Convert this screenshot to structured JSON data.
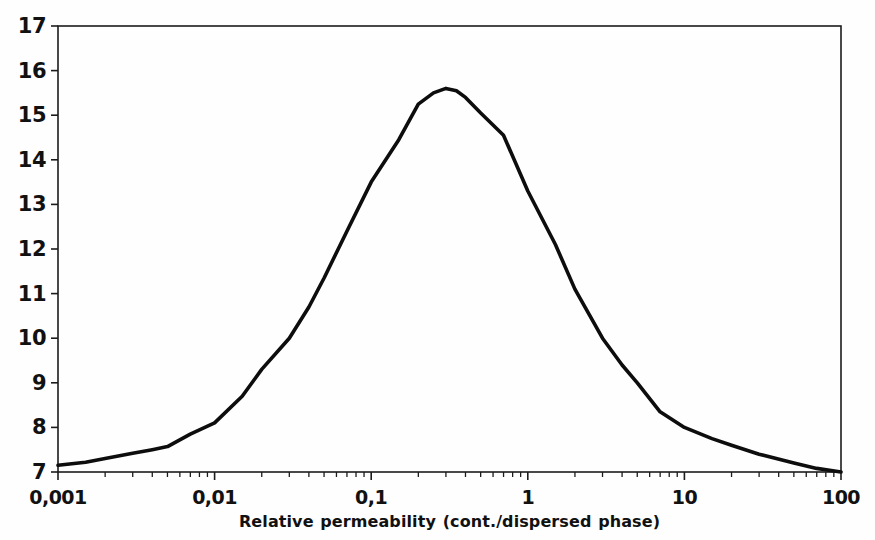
{
  "figure": {
    "background_color": "#fefefe",
    "axis_color": "#1c1c1c",
    "curve_color": "#0d0d0d",
    "label_color": "#111111"
  },
  "chart_data": {
    "type": "line",
    "title": "",
    "xlabel": "Relative permeability (cont./dispersed phase)",
    "ylabel": "",
    "x_scale": "log",
    "xlim": [
      0.001,
      100
    ],
    "ylim": [
      7,
      17
    ],
    "grid": false,
    "legend": "none",
    "x_tick_values": [
      0.001,
      0.01,
      0.1,
      1,
      10,
      100
    ],
    "x_tick_labels": [
      "0,001",
      "0,01",
      "0,1",
      "1",
      "10",
      "100"
    ],
    "y_tick_values": [
      7,
      8,
      9,
      10,
      11,
      12,
      13,
      14,
      15,
      16,
      17
    ],
    "y_tick_labels": [
      "7",
      "8",
      "9",
      "10",
      "11",
      "12",
      "13",
      "14",
      "15",
      "16",
      "17"
    ],
    "series": [
      {
        "name": "curve",
        "points": [
          [
            0.001,
            7.15
          ],
          [
            0.0015,
            7.22
          ],
          [
            0.002,
            7.3
          ],
          [
            0.003,
            7.42
          ],
          [
            0.004,
            7.5
          ],
          [
            0.005,
            7.57
          ],
          [
            0.007,
            7.85
          ],
          [
            0.01,
            8.1
          ],
          [
            0.015,
            8.7
          ],
          [
            0.02,
            9.3
          ],
          [
            0.03,
            10.0
          ],
          [
            0.04,
            10.7
          ],
          [
            0.05,
            11.35
          ],
          [
            0.07,
            12.4
          ],
          [
            0.1,
            13.5
          ],
          [
            0.15,
            14.45
          ],
          [
            0.2,
            15.25
          ],
          [
            0.25,
            15.5
          ],
          [
            0.3,
            15.6
          ],
          [
            0.35,
            15.55
          ],
          [
            0.4,
            15.4
          ],
          [
            0.5,
            15.05
          ],
          [
            0.7,
            14.55
          ],
          [
            1,
            13.3
          ],
          [
            1.5,
            12.1
          ],
          [
            2,
            11.1
          ],
          [
            3,
            10.0
          ],
          [
            4,
            9.4
          ],
          [
            5,
            9.0
          ],
          [
            7,
            8.35
          ],
          [
            10,
            8.0
          ],
          [
            15,
            7.75
          ],
          [
            20,
            7.6
          ],
          [
            30,
            7.4
          ],
          [
            50,
            7.2
          ],
          [
            70,
            7.08
          ],
          [
            100,
            7.0
          ]
        ]
      }
    ]
  }
}
